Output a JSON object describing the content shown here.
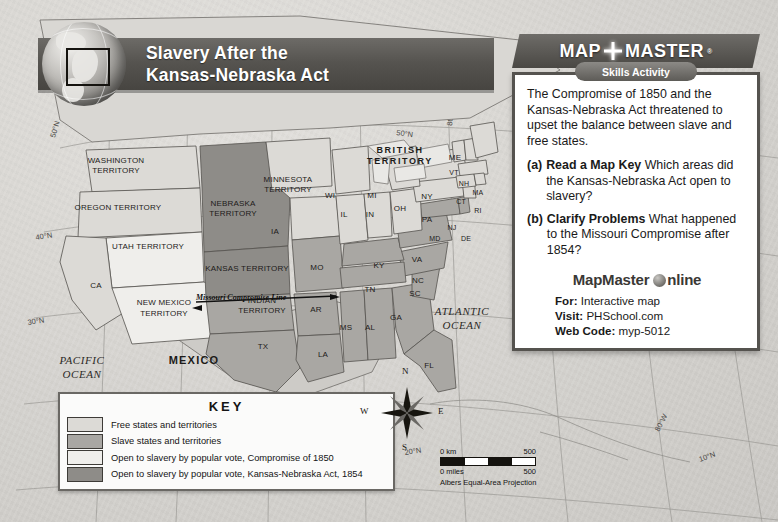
{
  "title_banner": {
    "line1": "Slavery After the",
    "line2": "Kansas-Nebraska Act",
    "globe_icon": "globe-icon"
  },
  "mapmaster": {
    "brand_left": "MAP",
    "brand_right": "MASTER",
    "registered": "®",
    "skills_label": "Skills Activity",
    "intro": "The Compromise of 1850 and the Kansas-Nebraska Act threatened to upset the balance between slave and free states.",
    "questions": [
      {
        "marker": "(a)",
        "bold": "Read a Map Key",
        "text": "Which areas did the Kansas-Nebraska Act open to slavery?"
      },
      {
        "marker": "(b)",
        "bold": "Clarify Problems",
        "text": "What happened to the Missouri Compromise after 1854?"
      }
    ],
    "online_brand": "MapMaster",
    "online_word": "nline",
    "rows": [
      {
        "label": "For:",
        "value": "Interactive map"
      },
      {
        "label": "Visit:",
        "value": "PHSchool.com"
      },
      {
        "label": "Web Code:",
        "value": "myp-5012"
      }
    ]
  },
  "key": {
    "title": "KEY",
    "items": [
      {
        "label": "Free states and territories",
        "color": "#dcdad6"
      },
      {
        "label": "Slave states and territories",
        "color": "#a9a7a3"
      },
      {
        "label": "Open to slavery by popular vote, Compromise of 1850",
        "color": "#efeeeb"
      },
      {
        "label": "Open to slavery by popular vote, Kansas-Nebraska Act, 1854",
        "color": "#8e8c88"
      }
    ]
  },
  "compass": {
    "n": "N",
    "e": "E",
    "s": "S",
    "w": "W"
  },
  "scale": {
    "km_zero": "0 km",
    "km_max": "500",
    "mi_zero": "0 miles",
    "mi_max": "500",
    "projection": "Albers Equal-Area Projection"
  },
  "map": {
    "oceans": [
      {
        "name": "PACIFIC OCEAN",
        "line1": "PACIFIC",
        "line2": "OCEAN"
      },
      {
        "name": "ATLANTIC OCEAN",
        "line1": "ATLANTIC",
        "line2": "OCEAN"
      }
    ],
    "countries": [
      {
        "name": "MEXICO"
      },
      {
        "name": "BRITISH TERRITORY",
        "line1": "BRITISH",
        "line2": "TERRITORY"
      }
    ],
    "territories": [
      {
        "name": "WASHINGTON TERRITORY",
        "line1": "WASHINGTON",
        "line2": "TERRITORY",
        "status": "free"
      },
      {
        "name": "OREGON TERRITORY",
        "line1": "OREGON TERRITORY",
        "line2": "",
        "status": "free"
      },
      {
        "name": "UTAH TERRITORY",
        "line1": "UTAH TERRITORY",
        "line2": "",
        "status": "comp1850"
      },
      {
        "name": "NEW MEXICO TERRITORY",
        "line1": "NEW MEXICO",
        "line2": "TERRITORY",
        "status": "comp1850"
      },
      {
        "name": "MINNESOTA TERRITORY",
        "line1": "MINNESOTA",
        "line2": "TERRITORY",
        "status": "free"
      },
      {
        "name": "NEBRASKA TERRITORY",
        "line1": "NEBRASKA",
        "line2": "TERRITORY",
        "status": "kansas_nebraska_1854"
      },
      {
        "name": "KANSAS TERRITORY",
        "line1": "KANSAS TERRITORY",
        "line2": "",
        "status": "kansas_nebraska_1854"
      },
      {
        "name": "INDIAN TERRITORY",
        "line1": "INDIAN",
        "line2": "TERRITORY",
        "status": "slave"
      }
    ],
    "states": [
      {
        "abbr": "CA",
        "status": "free"
      },
      {
        "abbr": "TX",
        "status": "slave"
      },
      {
        "abbr": "IA",
        "status": "free"
      },
      {
        "abbr": "MO",
        "status": "slave"
      },
      {
        "abbr": "AR",
        "status": "slave"
      },
      {
        "abbr": "LA",
        "status": "slave"
      },
      {
        "abbr": "MS",
        "status": "slave"
      },
      {
        "abbr": "AL",
        "status": "slave"
      },
      {
        "abbr": "GA",
        "status": "slave"
      },
      {
        "abbr": "FL",
        "status": "slave"
      },
      {
        "abbr": "SC",
        "status": "slave"
      },
      {
        "abbr": "NC",
        "status": "slave"
      },
      {
        "abbr": "TN",
        "status": "slave"
      },
      {
        "abbr": "KY",
        "status": "slave"
      },
      {
        "abbr": "VA",
        "status": "slave"
      },
      {
        "abbr": "MD",
        "status": "slave"
      },
      {
        "abbr": "DE",
        "status": "slave"
      },
      {
        "abbr": "NJ",
        "status": "free"
      },
      {
        "abbr": "PA",
        "status": "free"
      },
      {
        "abbr": "OH",
        "status": "free"
      },
      {
        "abbr": "IN",
        "status": "free"
      },
      {
        "abbr": "IL",
        "status": "free"
      },
      {
        "abbr": "WI",
        "status": "free"
      },
      {
        "abbr": "MI",
        "status": "free"
      },
      {
        "abbr": "NY",
        "status": "free"
      },
      {
        "abbr": "VT",
        "status": "free"
      },
      {
        "abbr": "NH",
        "status": "free"
      },
      {
        "abbr": "MA",
        "status": "free"
      },
      {
        "abbr": "CT",
        "status": "free"
      },
      {
        "abbr": "RI",
        "status": "free"
      },
      {
        "abbr": "ME",
        "status": "free"
      }
    ],
    "annotations": [
      {
        "name": "missouri-compromise-line",
        "text": "Missouri Compromise Line"
      }
    ],
    "graticule": {
      "longitudes": [
        "120°W",
        "110°W",
        "100°W",
        "90°W",
        "80°W",
        "80°W"
      ],
      "latitudes": [
        "50°N",
        "50°N",
        "40°N",
        "30°N",
        "20°N",
        "10°N"
      ]
    }
  }
}
